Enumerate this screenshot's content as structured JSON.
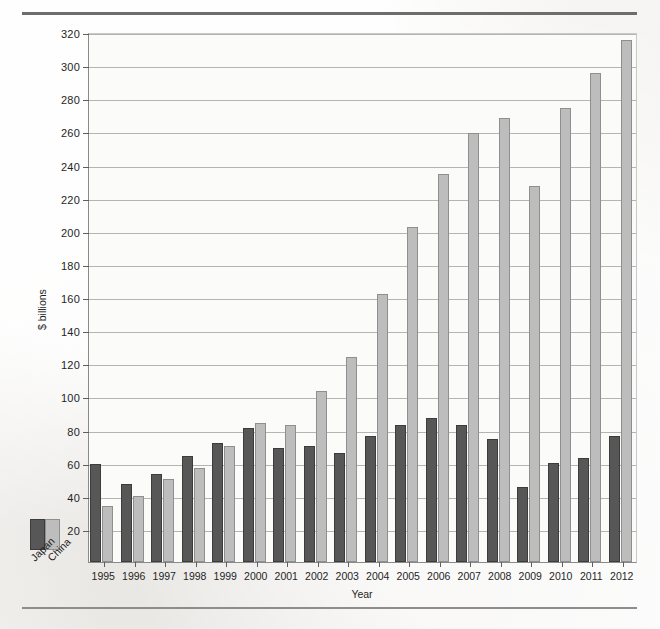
{
  "figure": {
    "background_color": "#f4f3f1",
    "plot_background_color": "#fbfbfa",
    "rule_color": "#6d6d6d"
  },
  "legend": {
    "japan_label": "Japan",
    "china_label": "China",
    "japan_color": "#575757",
    "china_color": "#bdbdbd"
  },
  "caption": {
    "text": ""
  },
  "chart_data": {
    "type": "bar",
    "title": "",
    "subtitle": "",
    "xlabel": "Year",
    "ylabel": "$ billions",
    "ylim": [
      0,
      320
    ],
    "ytick_step": 20,
    "yticks": [
      20,
      40,
      60,
      80,
      100,
      120,
      140,
      160,
      180,
      200,
      220,
      240,
      260,
      280,
      300,
      320
    ],
    "grid": true,
    "legend_position": "lower-left-outside",
    "categories": [
      "1995",
      "1996",
      "1997",
      "1998",
      "1999",
      "2000",
      "2001",
      "2002",
      "2003",
      "2004",
      "2005",
      "2006",
      "2007",
      "2008",
      "2009",
      "2010",
      "2011",
      "2012"
    ],
    "series": [
      {
        "name": "Japan",
        "color": "#575757",
        "values": [
          59,
          47,
          53,
          64,
          72,
          81,
          69,
          70,
          66,
          76,
          83,
          87,
          83,
          74,
          45,
          60,
          63,
          76
        ]
      },
      {
        "name": "China",
        "color": "#bdbdbd",
        "values": [
          34,
          40,
          50,
          57,
          70,
          84,
          83,
          103,
          124,
          162,
          202,
          234,
          259,
          268,
          227,
          274,
          295,
          315
        ]
      }
    ]
  }
}
